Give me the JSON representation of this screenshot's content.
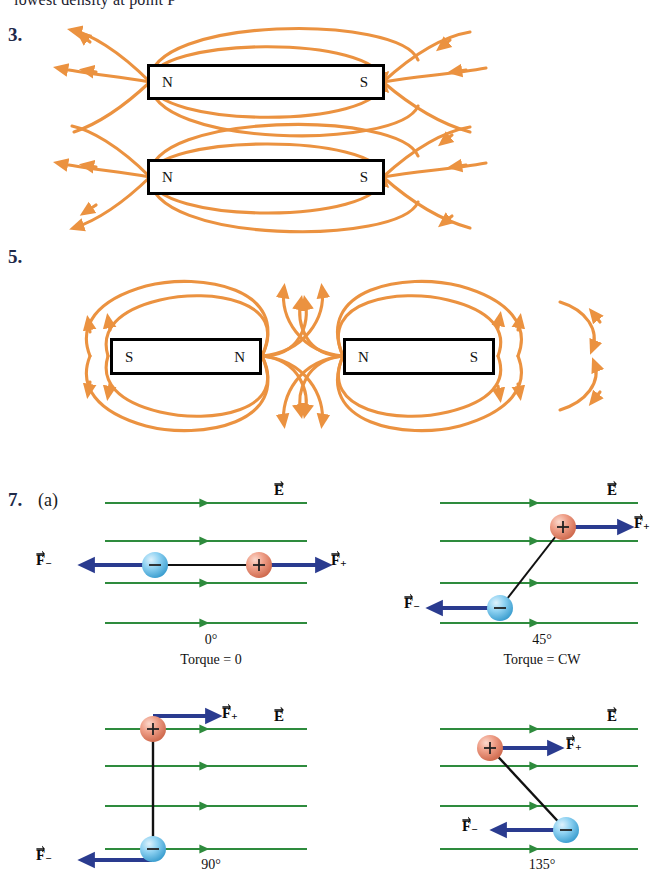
{
  "page": {
    "clipped_top_text": "lowest density at point P",
    "background_color": "#ffffff"
  },
  "colors": {
    "magnetic_field_line": "#eb9240",
    "electric_field_line": "#2e8b3d",
    "force_arrow": "#2a3b8f",
    "positive_charge": "#e8927c",
    "negative_charge": "#7ec8ee",
    "question_number": "#1f2a4a",
    "magnet_border": "#000000"
  },
  "problems": [
    {
      "number": "3.",
      "magnets": [
        {
          "left_pole": "N",
          "right_pole": "S"
        },
        {
          "left_pole": "N",
          "right_pole": "S"
        }
      ]
    },
    {
      "number": "5.",
      "magnets": [
        {
          "left_pole": "S",
          "right_pole": "N"
        },
        {
          "left_pole": "N",
          "right_pole": "S"
        }
      ]
    },
    {
      "number": "7.",
      "part": "(a)",
      "panels": [
        {
          "angle": "0°",
          "torque": "Torque = 0",
          "field_label": "E",
          "force_positive": "F",
          "force_positive_sub": "+",
          "force_negative": "F",
          "force_negative_sub": "−",
          "positive_sign": "+",
          "negative_sign": "−"
        },
        {
          "angle": "45°",
          "torque": "Torque = CW",
          "field_label": "E",
          "force_positive": "F",
          "force_positive_sub": "+",
          "force_negative": "F",
          "force_negative_sub": "−",
          "positive_sign": "+",
          "negative_sign": "−"
        },
        {
          "angle": "90°",
          "torque": "",
          "field_label": "E",
          "force_positive": "F",
          "force_positive_sub": "+",
          "force_negative": "F",
          "force_negative_sub": "−",
          "positive_sign": "+",
          "negative_sign": "−"
        },
        {
          "angle": "135°",
          "torque": "",
          "field_label": "E",
          "force_positive": "F",
          "force_positive_sub": "+",
          "force_negative": "F",
          "force_negative_sub": "−",
          "positive_sign": "+",
          "negative_sign": "−"
        }
      ]
    }
  ]
}
